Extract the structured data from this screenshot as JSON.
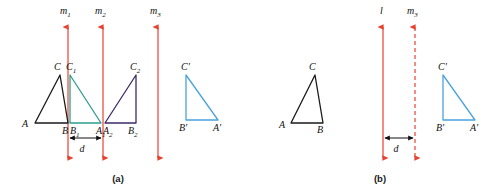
{
  "figure": {
    "width": 501,
    "height": 195,
    "background": "#ffffff"
  },
  "colors": {
    "mirror_line": "#e8412f",
    "triangle_original": "#1a1a1a",
    "triangle_first_image": "#2e9e8f",
    "triangle_second_image": "#3b2a68",
    "triangle_final_image": "#4aa3dd",
    "text": "#111111",
    "dimension_arrow": "#111111"
  },
  "panels": [
    {
      "id": "panel-a",
      "caption": "(a)",
      "caption_pos": {
        "x": 118,
        "y": 182
      },
      "mirror_lines": [
        {
          "name": "m1",
          "label": "m",
          "sub": "1",
          "x": 68,
          "y_top": 27,
          "y_bottom": 158,
          "style": "solid",
          "label_pos": {
            "x": 60,
            "y": 14
          }
        },
        {
          "name": "m2",
          "label": "m",
          "sub": "2",
          "x": 103,
          "y_top": 27,
          "y_bottom": 158,
          "style": "solid",
          "label_pos": {
            "x": 95,
            "y": 14
          }
        },
        {
          "name": "m3",
          "label": "m",
          "sub": "3",
          "x": 158,
          "y_top": 27,
          "y_bottom": 158,
          "style": "solid",
          "label_pos": {
            "x": 150,
            "y": 14
          }
        }
      ],
      "triangles": [
        {
          "name": "triangle-ABC",
          "color_key": "triangle_original",
          "points": "35,123 68,123 60,75",
          "vertices": [
            {
              "label": "A",
              "sub": "",
              "x": 22,
              "y": 127
            },
            {
              "label": "B",
              "sub": "",
              "x": 62,
              "y": 134
            },
            {
              "label": "C",
              "sub": "",
              "x": 54,
              "y": 70
            }
          ]
        },
        {
          "name": "triangle-A1B1C1",
          "color_key": "triangle_first_image",
          "points": "70,123 101,123 70,75",
          "vertices": [
            {
              "label": "B",
              "sub": "1",
              "x": 70,
              "y": 134
            },
            {
              "label": "A",
              "sub": "1",
              "x": 96,
              "y": 134
            },
            {
              "label": "C",
              "sub": "1",
              "x": 66,
              "y": 70
            }
          ]
        },
        {
          "name": "triangle-A2B2C2",
          "color_key": "triangle_second_image",
          "points": "105,123 136,123 136,75",
          "vertices": [
            {
              "label": "A",
              "sub": "2",
              "x": 103,
              "y": 134
            },
            {
              "label": "B",
              "sub": "2",
              "x": 128,
              "y": 134
            },
            {
              "label": "C",
              "sub": "2",
              "x": 130,
              "y": 70
            }
          ]
        },
        {
          "name": "triangle-A-prime-B-prime-C-prime",
          "color_key": "triangle_final_image",
          "points": "186,120 218,120 186,75",
          "vertices": [
            {
              "label": "B′",
              "sub": "",
              "x": 179,
              "y": 131
            },
            {
              "label": "A′",
              "sub": "",
              "x": 213,
              "y": 131
            },
            {
              "label": "C′",
              "sub": "",
              "x": 181,
              "y": 70
            }
          ]
        }
      ],
      "dimension": {
        "name": "distance-d-panel-a",
        "label": "d",
        "x_start": 68,
        "x_end": 103,
        "y": 138,
        "label_pos": {
          "x": 82,
          "y": 152
        }
      }
    },
    {
      "id": "panel-b",
      "caption": "(b)",
      "caption_pos": {
        "x": 380,
        "y": 182
      },
      "mirror_lines": [
        {
          "name": "l",
          "label": "l",
          "sub": "",
          "x": 383,
          "y_top": 27,
          "y_bottom": 158,
          "style": "solid",
          "label_pos": {
            "x": 380,
            "y": 14
          }
        },
        {
          "name": "m3",
          "label": "m",
          "sub": "3",
          "x": 415,
          "y_top": 27,
          "y_bottom": 158,
          "style": "dashed",
          "label_pos": {
            "x": 407,
            "y": 14
          }
        }
      ],
      "triangles": [
        {
          "name": "triangle-ABC",
          "color_key": "triangle_original",
          "points": "291,123 323,123 315,75",
          "vertices": [
            {
              "label": "A",
              "sub": "",
              "x": 279,
              "y": 128
            },
            {
              "label": "B",
              "sub": "",
              "x": 317,
              "y": 133
            },
            {
              "label": "C",
              "sub": "",
              "x": 309,
              "y": 70
            }
          ]
        },
        {
          "name": "triangle-A-prime-B-prime-C-prime",
          "color_key": "triangle_final_image",
          "points": "443,120 475,120 443,75",
          "vertices": [
            {
              "label": "B′",
              "sub": "",
              "x": 436,
              "y": 131
            },
            {
              "label": "A′",
              "sub": "",
              "x": 470,
              "y": 131
            },
            {
              "label": "C′",
              "sub": "",
              "x": 438,
              "y": 70
            }
          ]
        }
      ],
      "dimension": {
        "name": "distance-d-panel-b",
        "label": "d",
        "x_start": 383,
        "x_end": 415,
        "y": 138,
        "label_pos": {
          "x": 396,
          "y": 152
        }
      }
    }
  ]
}
